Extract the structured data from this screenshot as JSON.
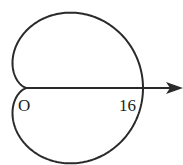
{
  "diagram": {
    "type": "polar-curve",
    "curve": "cardioid",
    "equation_form": "r = 8(1 + cos θ)",
    "pole_label": "O",
    "axis_label_value": "16",
    "colors": {
      "stroke": "#2a2a2a",
      "background": "#ffffff",
      "text": "#222222"
    }
  }
}
